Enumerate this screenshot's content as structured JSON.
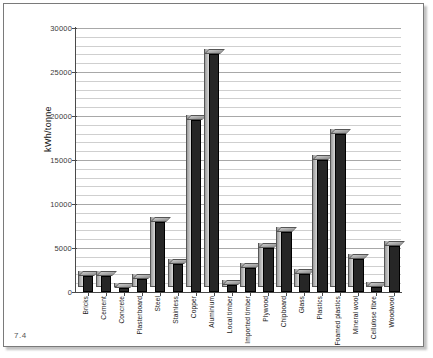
{
  "figure": {
    "number": "7.4"
  },
  "chart_data": {
    "type": "bar",
    "title": "",
    "xlabel": "",
    "ylabel": "kWh/tonne",
    "ylim": [
      0,
      30000
    ],
    "ytick_labels": [
      "0",
      "5000",
      "10000",
      "15000",
      "20000",
      "25000",
      "30000"
    ],
    "ytick_values": [
      0,
      5000,
      10000,
      15000,
      20000,
      25000,
      30000
    ],
    "minor_gridline_step": 1000,
    "grid": true,
    "legend": "none",
    "style": "3d-bar",
    "bar_color": "#262626",
    "categories": [
      "Bricks",
      "Cement",
      "Concrete",
      "Plasterboard",
      "Steel",
      "Stainless",
      "Copper",
      "Aluminium",
      "Local timber",
      "Imported timber",
      "Plywood",
      "Chipboard",
      "Glass",
      "Plastics",
      "Foamed plastics",
      "Mineral wool",
      "Cellulose fibre",
      "Woodwool"
    ],
    "values": [
      1800,
      1800,
      400,
      1500,
      8000,
      3200,
      19500,
      27000,
      800,
      2700,
      5000,
      6800,
      2000,
      15000,
      18000,
      3700,
      600,
      5200
    ]
  }
}
